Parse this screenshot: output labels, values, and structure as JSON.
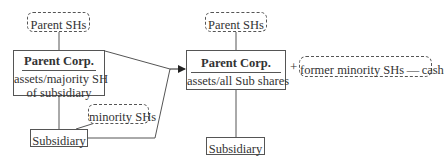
{
  "left": {
    "parent_shs": "Parent SHs",
    "parent_corp": {
      "title": "Parent Corp.",
      "line1": "assets/majority SH",
      "line2": "of subsidiary"
    },
    "minority_shs": "minority SHs",
    "subsidiary": "Subsidiary"
  },
  "right": {
    "parent_shs": "Parent SHs",
    "parent_corp": {
      "title": "Parent Corp.",
      "line1": "assets/all Sub shares"
    },
    "plus": "+",
    "former_minority": "former minority SHs — cash",
    "subsidiary": "Subsidiary"
  },
  "colors": {
    "line": "#555555",
    "text": "#333333",
    "background": "#ffffff"
  }
}
